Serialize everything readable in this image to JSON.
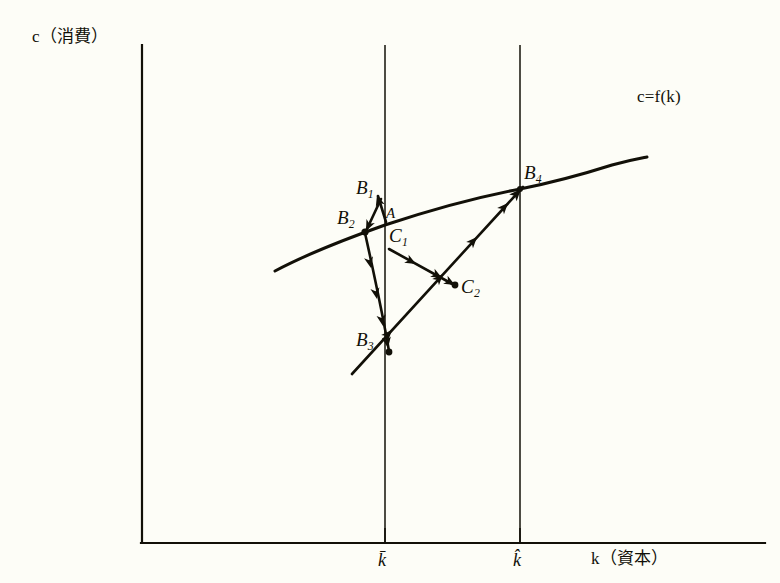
{
  "figure": {
    "title": "c=f(k) consumption-capital transition diagram",
    "background_color": "#fdfdf7",
    "ink_color": "#121008",
    "axes": {
      "y_axis_label": "c（消費）",
      "y_axis_label_plain": "c (consumption)",
      "x_axis_label": "k（資本）",
      "x_axis_label_plain": "k (capital)",
      "origin_px": [
        142,
        543
      ],
      "x_axis_end_px": [
        765,
        543
      ],
      "y_axis_top_px": [
        142,
        45
      ]
    },
    "curve": {
      "label": "c=f(k)",
      "shape": "concave-increasing",
      "description": "production / consumption function"
    },
    "ticks": [
      {
        "name": "k-bar",
        "label": "k̄",
        "x_px": 385
      },
      {
        "name": "k-hat",
        "label": "k̂",
        "x_px": 520
      }
    ],
    "vertical_lines": [
      {
        "name": "k-bar-line",
        "x_px": 385,
        "y_top_px": 45,
        "y_bottom_px": 543
      },
      {
        "name": "k-hat-line",
        "x_px": 520,
        "y_top_px": 45,
        "y_bottom_px": 543
      }
    ],
    "points": [
      {
        "name": "A",
        "label": "A",
        "sub": "",
        "x_px": 385,
        "y_px": 218
      },
      {
        "name": "B1",
        "label": "B",
        "sub": "1",
        "x_px": 383,
        "y_px": 205
      },
      {
        "name": "B2",
        "label": "B",
        "sub": "2",
        "x_px": 365,
        "y_px": 232
      },
      {
        "name": "B3",
        "label": "B",
        "sub": "3",
        "x_px": 388,
        "y_px": 352
      },
      {
        "name": "B4",
        "label": "B",
        "sub": "4",
        "x_px": 520,
        "y_px": 190
      },
      {
        "name": "C1",
        "label": "C",
        "sub": "1",
        "x_px": 390,
        "y_px": 248
      },
      {
        "name": "C2",
        "label": "C",
        "sub": "2",
        "x_px": 455,
        "y_px": 285
      }
    ],
    "point_labels": [
      {
        "name": "label-B1",
        "text": "B",
        "sub": "1",
        "x_px": 356,
        "y_px": 178
      },
      {
        "name": "label-B2",
        "text": "B",
        "sub": "2",
        "x_px": 337,
        "y_px": 208
      },
      {
        "name": "label-A",
        "text": "A",
        "sub": "",
        "x_px": 386,
        "y_px": 206
      },
      {
        "name": "label-C1",
        "text": "C",
        "sub": "1",
        "x_px": 390,
        "y_px": 226
      },
      {
        "name": "label-C2",
        "text": "C",
        "sub": "2",
        "x_px": 461,
        "y_px": 277
      },
      {
        "name": "label-B3",
        "text": "B",
        "sub": "3",
        "x_px": 356,
        "y_px": 330
      },
      {
        "name": "label-B4",
        "text": "B",
        "sub": "4",
        "x_px": 524,
        "y_px": 163
      }
    ],
    "trajectories": [
      {
        "name": "path-A-to-B1",
        "from": "A",
        "to": "B1",
        "arrowheads": 1
      },
      {
        "name": "path-B1-to-B2",
        "from": "B1",
        "to": "B2",
        "arrowheads": 1
      },
      {
        "name": "path-B2-to-B3",
        "from": "B2",
        "to": "B3",
        "arrowheads": 4
      },
      {
        "name": "path-B3-to-B4",
        "from": "B3",
        "to": "B4",
        "arrowheads": 4
      },
      {
        "name": "path-C1-to-C2",
        "from": "C1",
        "to": "C2",
        "arrowheads": 2
      }
    ]
  }
}
